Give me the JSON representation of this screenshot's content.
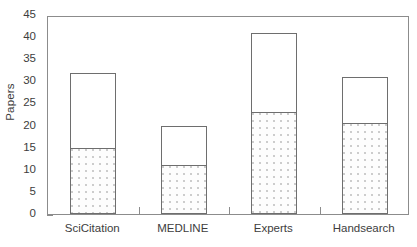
{
  "chart_data": {
    "type": "bar",
    "title": "",
    "xlabel": "",
    "ylabel": "Papers",
    "ylim": [
      0,
      45
    ],
    "ytick_step": 5,
    "yticks": [
      0,
      5,
      10,
      15,
      20,
      25,
      30,
      35,
      40,
      45
    ],
    "grid": false,
    "legend": "none",
    "stacked": true,
    "categories": [
      "SciCitation",
      "MEDLINE",
      "Experts",
      "Handsearch"
    ],
    "series": [
      {
        "name": "lower-segment",
        "style": "stippled",
        "values": [
          15,
          11,
          23,
          20.5
        ]
      },
      {
        "name": "upper-segment",
        "style": "open",
        "values": [
          17,
          9,
          18,
          10.5
        ]
      }
    ],
    "totals": [
      32,
      20,
      41,
      31
    ],
    "colors": {
      "bar_outline": "#6e6e6e",
      "frame": "#8c8c8c",
      "upper_fill": "#ffffff",
      "lower_fill": "#fdfdfd",
      "stipple": "#cccccc",
      "text": "#3d3d3d"
    }
  }
}
